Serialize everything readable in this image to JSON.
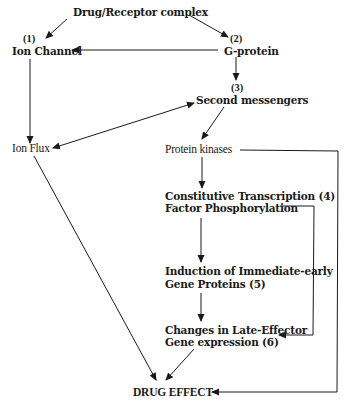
{
  "diagram": {
    "type": "flowchart",
    "nodes": {
      "drug_receptor": {
        "label": "Drug/Receptor complex"
      },
      "ion_channel": {
        "number": "(1)",
        "label": "Ion Channel"
      },
      "g_protein": {
        "number": "(2)",
        "label": "G-protein"
      },
      "second_messengers": {
        "number": "(3)",
        "label": "Second messengers"
      },
      "ion_flux": {
        "label": "Ion Flux"
      },
      "protein_kinases": {
        "label": "Protein kinases"
      },
      "transcription": {
        "line1": "Constitutive Transcription (4)",
        "line2": "Factor Phosphorylation"
      },
      "immediate_early": {
        "line1": "Induction of Immediate-early",
        "line2": "Gene Proteins (5)"
      },
      "late_effector": {
        "line1": "Changes in Late-Effector",
        "line2": "Gene expression (6)"
      },
      "drug_effect": {
        "label": "DRUG EFFECT"
      }
    },
    "edges": [
      {
        "from": "Drug/Receptor complex",
        "to": "Ion Channel"
      },
      {
        "from": "Drug/Receptor complex",
        "to": "G-protein"
      },
      {
        "from": "G-protein",
        "to": "Ion Channel"
      },
      {
        "from": "G-protein",
        "to": "Second messengers"
      },
      {
        "from": "Ion Channel",
        "to": "Ion Flux"
      },
      {
        "from": "Second messengers",
        "to": "Ion Flux",
        "bidirectional": true
      },
      {
        "from": "Second messengers",
        "to": "Protein kinases"
      },
      {
        "from": "Protein kinases",
        "to": "Constitutive Transcription Factor Phosphorylation"
      },
      {
        "from": "Protein kinases",
        "to": "DRUG EFFECT"
      },
      {
        "from": "Constitutive Transcription Factor Phosphorylation",
        "to": "Induction of Immediate-early Gene Proteins"
      },
      {
        "from": "Constitutive Transcription Factor Phosphorylation",
        "to": "Changes in Late-Effector Gene expression"
      },
      {
        "from": "Induction of Immediate-early Gene Proteins",
        "to": "Changes in Late-Effector Gene expression"
      },
      {
        "from": "Changes in Late-Effector Gene expression",
        "to": "DRUG EFFECT"
      },
      {
        "from": "Ion Flux",
        "to": "DRUG EFFECT"
      }
    ],
    "colors": {
      "line": "#1a1a1a",
      "background": "#ffffff"
    }
  }
}
